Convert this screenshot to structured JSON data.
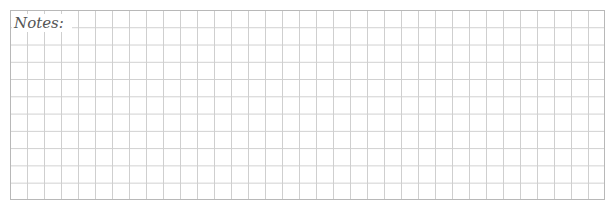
{
  "notes": {
    "label": "Notes:",
    "grid": {
      "columns": 35,
      "rows": 11,
      "line_color": "#cfcfcf",
      "border_color": "#b8b8b8"
    },
    "content": ""
  }
}
